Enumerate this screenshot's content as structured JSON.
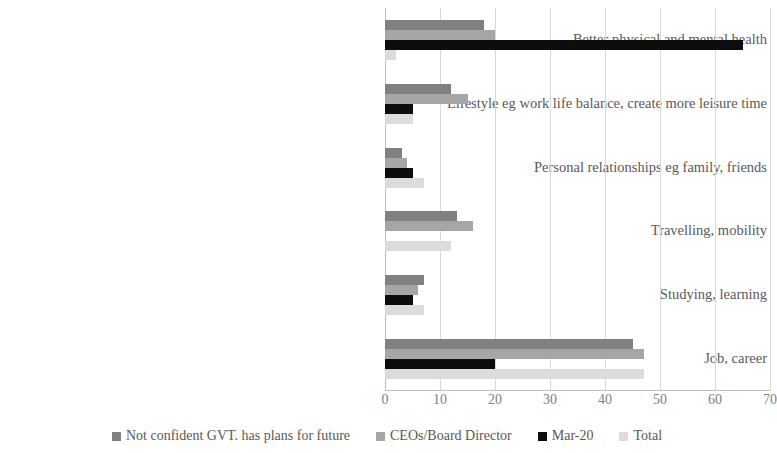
{
  "chart_data": {
    "type": "bar",
    "orientation": "horizontal",
    "title": "",
    "xlabel": "",
    "ylabel": "",
    "xlim": [
      0,
      70
    ],
    "xticks": [
      0,
      10,
      20,
      30,
      40,
      50,
      60,
      70
    ],
    "grid": true,
    "legend_position": "bottom",
    "categories": [
      "Better physical and mental health",
      "Lifestyle eg work life balance, create more leisure time",
      "Personal relationships eg family, friends",
      "Travelling, mobility",
      "Studying, learning",
      "Job, career"
    ],
    "series": [
      {
        "name": "Not confident GVT. has plans for future",
        "color": "#808080",
        "values": [
          18,
          12,
          3,
          13,
          7,
          45
        ]
      },
      {
        "name": "CEOs/Board Director",
        "color": "#a6a6a6",
        "values": [
          20,
          15,
          4,
          16,
          6,
          47
        ]
      },
      {
        "name": "Mar-20",
        "color": "#0d0d0d",
        "values": [
          65,
          5,
          5,
          0,
          5,
          20
        ]
      },
      {
        "name": "Total",
        "color": "#dcdcdc",
        "values": [
          2,
          5,
          7,
          12,
          7,
          47
        ]
      }
    ]
  },
  "legend": {
    "items": [
      {
        "label": "Not confident GVT. has plans for future",
        "color": "#808080"
      },
      {
        "label": "CEOs/Board Director",
        "color": "#a6a6a6"
      },
      {
        "label": "Mar-20",
        "color": "#0d0d0d"
      },
      {
        "label": "Total",
        "color": "#dcdcdc"
      }
    ]
  },
  "axis": {
    "tick_labels": [
      "0",
      "10",
      "20",
      "30",
      "40",
      "50",
      "60",
      "70"
    ]
  }
}
